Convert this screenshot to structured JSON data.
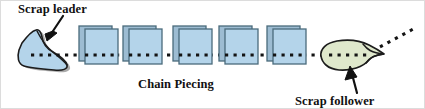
{
  "figure": {
    "background_color": "#ffffff",
    "width": 425,
    "height": 109
  },
  "labels": {
    "scrap_leader": "Scrap leader",
    "chain_piecing": "Chain Piecing",
    "scrap_follower": "Scrap follower"
  },
  "colors": {
    "fabric_fill": "#b4d4ea",
    "fabric_back_fill": "#9dbcd2",
    "fabric_outline": "#4a6b7c",
    "scrap_leader_fill": "#b4d4ea",
    "scrap_follower_fill": "#dfe8cc",
    "shape_outline": "#1a1a1a",
    "shadow": "#8a8a8a",
    "thread": "#141414",
    "text": "#111111"
  },
  "elements": {
    "scrap_leader_shape": "angular-blue-fabric-scrap",
    "scrap_follower_shape": "oval-green-fabric-scrap",
    "fabric_squares_count": 5,
    "thread_style": "dotted",
    "leader_arrow": "arrow-down-left",
    "follower_arrow": "arrow-up"
  }
}
